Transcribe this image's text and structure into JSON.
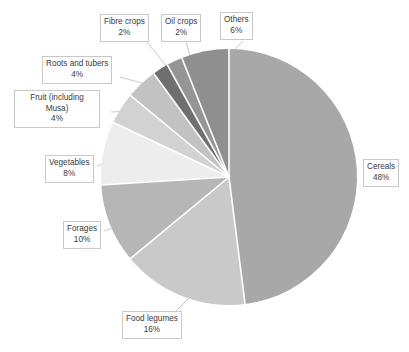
{
  "chart_data": {
    "type": "pie",
    "title": "",
    "subtitle": "",
    "xlabel": "",
    "ylabel": "",
    "legend_position": "none",
    "grid": false,
    "labels_show_percent": true,
    "start_angle_deg": 0,
    "direction": "clockwise",
    "categories": [
      "Cereals",
      "Food legumes",
      "Forages",
      "Vegetables",
      "Fruit (including Musa)",
      "Roots and tubers",
      "Fibre crops",
      "Oil crops",
      "Others"
    ],
    "values": [
      48,
      16,
      10,
      8,
      4,
      4,
      2,
      2,
      6
    ],
    "units": "%",
    "total": 100,
    "slices": [
      {
        "label": "Cereals",
        "value": 48,
        "percent_text": "48%",
        "color": "#a8a8a8"
      },
      {
        "label": "Food legumes",
        "value": 16,
        "percent_text": "16%",
        "color": "#c9c9c9"
      },
      {
        "label": "Forages",
        "value": 10,
        "percent_text": "10%",
        "color": "#b6b6b6"
      },
      {
        "label": "Vegetables",
        "value": 8,
        "percent_text": "8%",
        "color": "#ededed"
      },
      {
        "label": "Fruit (including Musa)",
        "value": 4,
        "percent_text": "4%",
        "color": "#d2d2d2"
      },
      {
        "label": "Roots and tubers",
        "value": 4,
        "percent_text": "4%",
        "color": "#c2c2c2"
      },
      {
        "label": "Fibre crops",
        "value": 2,
        "percent_text": "2%",
        "color": "#6f6f6f"
      },
      {
        "label": "Oil crops",
        "value": 2,
        "percent_text": "2%",
        "color": "#959595"
      },
      {
        "label": "Others",
        "value": 6,
        "percent_text": "6%",
        "color": "#8f8f8f"
      }
    ]
  },
  "callouts": {
    "fibre_crops": {
      "name": "Fibre crops",
      "value": "2%"
    },
    "oil_crops": {
      "name": "Oil crops",
      "value": "2%"
    },
    "others": {
      "name": "Others",
      "value": "6%"
    },
    "roots_tubers": {
      "name": "Roots and tubers",
      "value": "4%"
    },
    "fruit": {
      "name": "Fruit (including Musa)",
      "value": "4%"
    },
    "vegetables": {
      "name": "Vegetables",
      "value": "8%"
    },
    "forages": {
      "name": "Forages",
      "value": "10%"
    },
    "food_legumes": {
      "name": "Food legumes",
      "value": "16%"
    },
    "cereals": {
      "name": "Cereals",
      "value": "48%"
    }
  },
  "style": {
    "slice_separator_color": "#ffffff",
    "callout_border_color": "#c8c8c8",
    "leader_line_color": "#bdbdbd",
    "text_color": "#3a3a3a",
    "background": "#ffffff"
  }
}
